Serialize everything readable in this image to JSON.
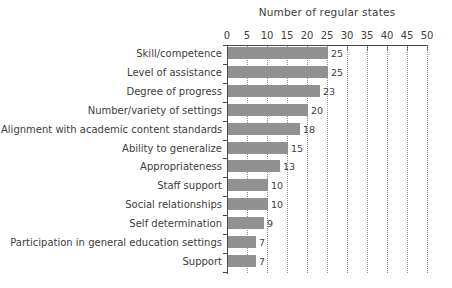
{
  "chart_data": {
    "type": "bar",
    "orientation": "horizontal",
    "title": "Number of regular states",
    "xlabel": "",
    "ylabel": "",
    "xlim": [
      0,
      50
    ],
    "xticks": [
      0,
      5,
      10,
      15,
      20,
      25,
      30,
      35,
      40,
      45,
      50
    ],
    "xtick_labels": [
      "0",
      "5",
      "10",
      "15",
      "20",
      "25",
      "30",
      "35",
      "40",
      "45",
      "50"
    ],
    "grid": "vertical-dotted",
    "legend": null,
    "bar_color": "#919191",
    "axis_color": "#4a4a4a",
    "background": "#ffffff",
    "categories": [
      "Skill/competence",
      "Level of assistance",
      "Degree of progress",
      "Number/variety of settings",
      "Alignment with academic content standards",
      "Ability to generalize",
      "Appropriateness",
      "Staff support",
      "Social relationships",
      "Self determination",
      "Participation in general education settings",
      "Support"
    ],
    "values": [
      25,
      25,
      23,
      20,
      18,
      15,
      13,
      10,
      10,
      9,
      7,
      7
    ],
    "data_labels": [
      "25",
      "25",
      "23",
      "20",
      "18",
      "15",
      "13",
      "10",
      "10",
      "9",
      "7",
      "7"
    ]
  }
}
